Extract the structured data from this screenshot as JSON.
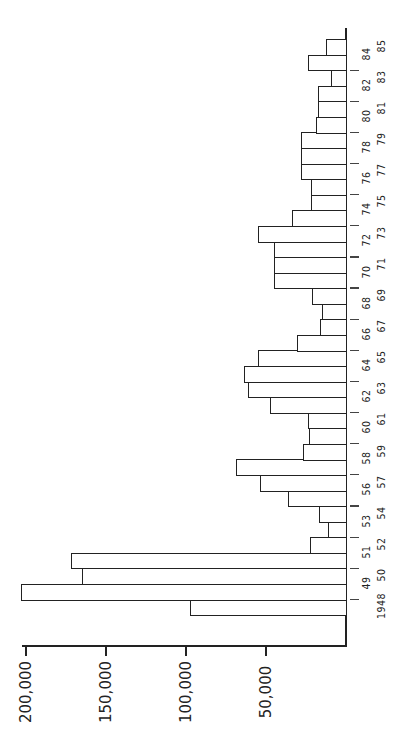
{
  "chart_data": {
    "type": "bar",
    "orientation": "horizontal (rotated page; years along vertical baseline, values extend left)",
    "title": "",
    "xlabel": "",
    "ylabel": "",
    "value_axis": {
      "ticks": [
        200000,
        150000,
        100000,
        50000
      ],
      "tick_labels": [
        "200,000",
        "150,000",
        "100,000",
        "50,000"
      ],
      "range": [
        0,
        205000
      ]
    },
    "grid": false,
    "legend": null,
    "categories": [
      "1948",
      "49",
      "50",
      "51",
      "52",
      "53",
      "54",
      "56",
      "57",
      "58",
      "59",
      "60",
      "61",
      "62",
      "63",
      "64",
      "65",
      "66",
      "67",
      "68",
      "69",
      "70",
      "71",
      "72",
      "73",
      "74",
      "75",
      "76",
      "77",
      "78",
      "79",
      "80",
      "81",
      "82",
      "83",
      "84",
      "85"
    ],
    "values": [
      97500,
      203000,
      165000,
      172000,
      22500,
      11000,
      17000,
      36000,
      54000,
      69000,
      27000,
      23000,
      24000,
      47500,
      61000,
      64000,
      55000,
      30500,
      16000,
      15000,
      21000,
      45000,
      45000,
      45000,
      55000,
      34000,
      22000,
      22000,
      28000,
      28000,
      28000,
      19000,
      17500,
      17500,
      9500,
      24000,
      12500
    ]
  }
}
